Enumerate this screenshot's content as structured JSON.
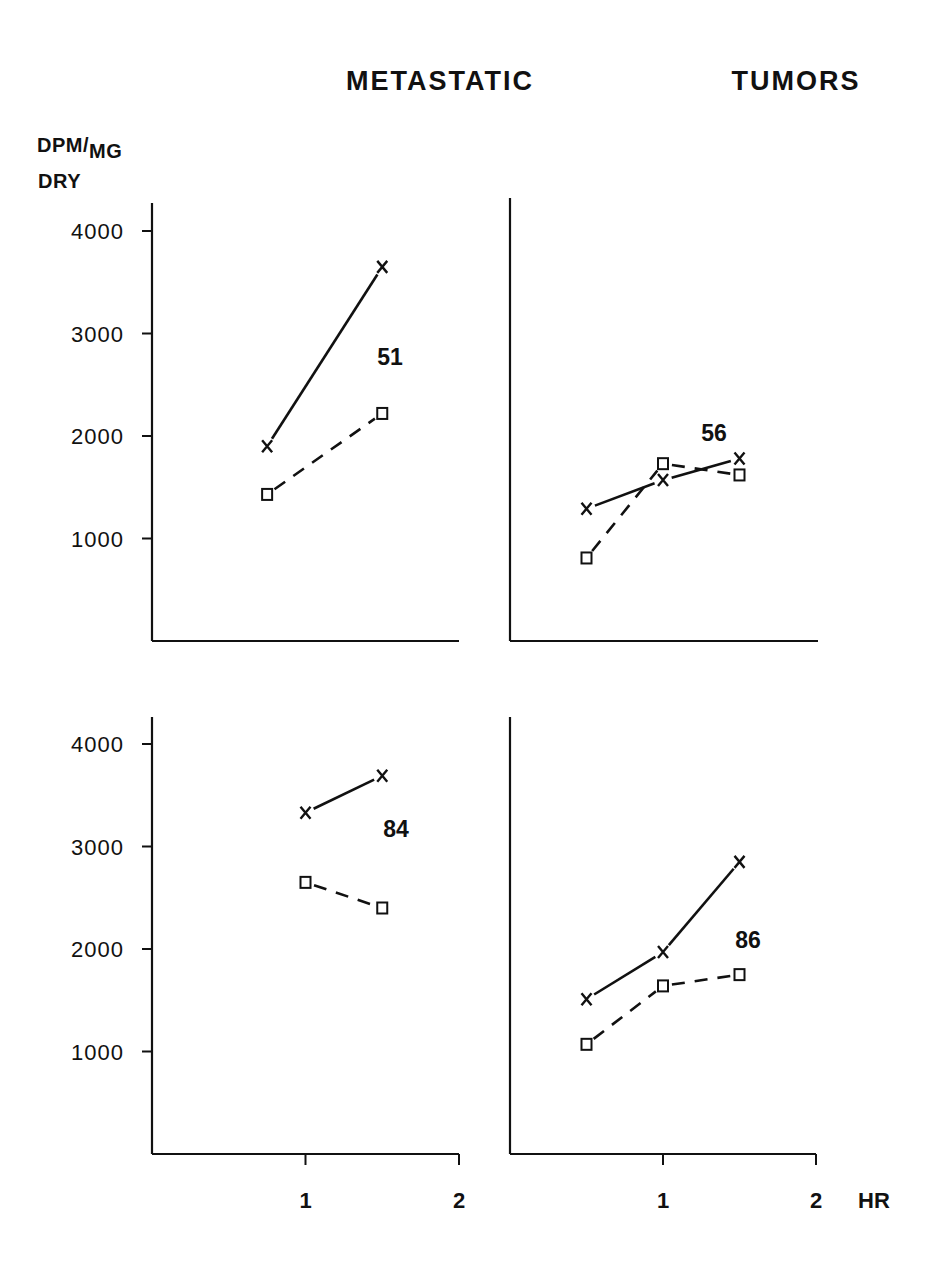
{
  "figure": {
    "title": "METASTATIC     TUMORS",
    "y_axis_label_line1": "DPM/",
    "y_axis_label_sub": "MG",
    "y_axis_label_line2": "DRY",
    "x_axis_unit": "HR"
  },
  "chart_data": [
    {
      "type": "line",
      "panel": "top-left",
      "annotation": "51",
      "title": "METASTATIC TUMORS",
      "xlabel": "HR",
      "ylabel": "DPM/MG DRY",
      "xlim": [
        0,
        2
      ],
      "ylim": [
        0,
        4000
      ],
      "yticks": [
        1000,
        2000,
        3000,
        4000
      ],
      "xticks": [],
      "grid": false,
      "series": [
        {
          "name": "x-marker (solid line)",
          "marker": "x",
          "line": "solid",
          "x": [
            0.75,
            1.5
          ],
          "values": [
            1900,
            3650
          ]
        },
        {
          "name": "square-marker (dashed line)",
          "marker": "square",
          "line": "dashed",
          "x": [
            0.75,
            1.5
          ],
          "values": [
            1430,
            2220
          ]
        }
      ]
    },
    {
      "type": "line",
      "panel": "top-right",
      "annotation": "56",
      "xlabel": "HR",
      "ylabel": "DPM/MG DRY",
      "xlim": [
        0,
        2
      ],
      "ylim": [
        0,
        4000
      ],
      "yticks": [],
      "xticks": [],
      "grid": false,
      "series": [
        {
          "name": "x-marker (solid line)",
          "marker": "x",
          "line": "solid",
          "x": [
            0.5,
            1.0,
            1.5
          ],
          "values": [
            1290,
            1570,
            1780
          ]
        },
        {
          "name": "square-marker (dashed line)",
          "marker": "square",
          "line": "dashed",
          "x": [
            0.5,
            1.0,
            1.5
          ],
          "values": [
            810,
            1730,
            1620
          ]
        }
      ]
    },
    {
      "type": "line",
      "panel": "bottom-left",
      "annotation": "84",
      "xlabel": "HR",
      "ylabel": "DPM/MG DRY",
      "xlim": [
        0,
        2
      ],
      "ylim": [
        0,
        4000
      ],
      "yticks": [
        1000,
        2000,
        3000,
        4000
      ],
      "xticks": [
        1,
        2
      ],
      "grid": false,
      "series": [
        {
          "name": "x-marker (solid line)",
          "marker": "x",
          "line": "solid",
          "x": [
            1.0,
            1.5
          ],
          "values": [
            3330,
            3690
          ]
        },
        {
          "name": "square-marker (dashed line)",
          "marker": "square",
          "line": "dashed",
          "x": [
            1.0,
            1.5
          ],
          "values": [
            2650,
            2400
          ]
        }
      ]
    },
    {
      "type": "line",
      "panel": "bottom-right",
      "annotation": "86",
      "xlabel": "HR",
      "ylabel": "DPM/MG DRY",
      "xlim": [
        0,
        2
      ],
      "ylim": [
        0,
        4000
      ],
      "yticks": [],
      "xticks": [
        1,
        2
      ],
      "grid": false,
      "series": [
        {
          "name": "x-marker (solid line)",
          "marker": "x",
          "line": "solid",
          "x": [
            0.5,
            1.0,
            1.5
          ],
          "values": [
            1510,
            1970,
            2850
          ]
        },
        {
          "name": "square-marker (dashed line)",
          "marker": "square",
          "line": "dashed",
          "x": [
            0.5,
            1.0,
            1.5
          ],
          "values": [
            1070,
            1640,
            1750
          ]
        }
      ]
    }
  ],
  "axis_labels": {
    "y_ticks": [
      "4000",
      "3000",
      "2000",
      "1000"
    ],
    "x_ticks": [
      "1",
      "2"
    ],
    "x_unit": "HR"
  },
  "colors": {
    "ink": "#111111",
    "background": "#ffffff"
  }
}
